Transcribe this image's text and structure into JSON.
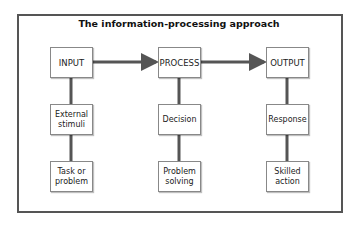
{
  "title": "The information-processing approach",
  "columns": [
    {
      "header": "INPUT",
      "items": [
        "External stimuli",
        "Task or problem"
      ]
    },
    {
      "header": "PROCESS",
      "items": [
        "Decision",
        "Problem solving"
      ]
    },
    {
      "header": "OUTPUT",
      "items": [
        "Response",
        "Skilled action"
      ]
    }
  ],
  "colors": {
    "line": "#555555",
    "box_border": "#888888"
  }
}
